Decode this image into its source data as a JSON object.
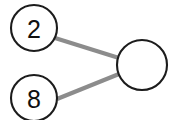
{
  "diagram": {
    "type": "node-link-graph",
    "background_color": "#ffffff",
    "node_fill_color": "#ffffff",
    "node_stroke_color": "#1c1c1c",
    "edge_color": "#8c8c8c",
    "label_color": "#101010",
    "nodes": [
      {
        "id": "node-2",
        "label": "2",
        "cx": 34,
        "cy": 28,
        "r": 23
      },
      {
        "id": "node-8",
        "label": "8",
        "cx": 34,
        "cy": 98,
        "r": 23
      },
      {
        "id": "node-empty",
        "label": "",
        "cx": 142,
        "cy": 65,
        "r": 25
      }
    ],
    "edges": [
      {
        "id": "edge-2-empty",
        "from": "node-2",
        "to": "node-empty",
        "x1": 55,
        "y1": 38,
        "x2": 119,
        "y2": 58
      },
      {
        "id": "edge-8-empty",
        "from": "node-8",
        "to": "node-empty",
        "x1": 57,
        "y1": 99,
        "x2": 119,
        "y2": 74
      }
    ]
  }
}
